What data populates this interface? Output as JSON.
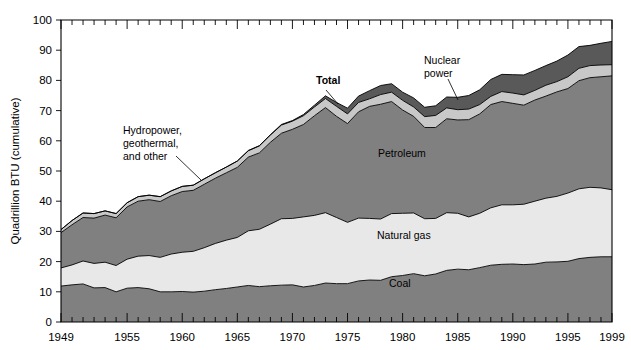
{
  "chart_data": {
    "type": "area",
    "stacked": true,
    "title": "",
    "xlabel": "",
    "ylabel": "Quadrillion BTU (cumulative)",
    "xlim": [
      1949,
      1999
    ],
    "ylim": [
      0,
      100
    ],
    "ytick_values": [
      0,
      10,
      20,
      30,
      40,
      50,
      60,
      70,
      80,
      90,
      100
    ],
    "ytick_labels": [
      "0",
      "10",
      "20",
      "30",
      "40",
      "50",
      "60",
      "70",
      "80",
      "90",
      "100"
    ],
    "xtick_values": [
      1949,
      1955,
      1960,
      1965,
      1970,
      1975,
      1980,
      1985,
      1990,
      1995,
      1999
    ],
    "xtick_labels": [
      "1949",
      "1955",
      "1960",
      "1965",
      "1970",
      "1975",
      "1980",
      "1985",
      "1990",
      "1995",
      "1999"
    ],
    "minor_xtick_interval": 1,
    "grid": false,
    "legend_position": "inline-annotations",
    "x": [
      1949,
      1950,
      1951,
      1952,
      1953,
      1954,
      1955,
      1956,
      1957,
      1958,
      1959,
      1960,
      1961,
      1962,
      1963,
      1964,
      1965,
      1966,
      1967,
      1968,
      1969,
      1970,
      1971,
      1972,
      1973,
      1974,
      1975,
      1976,
      1977,
      1978,
      1979,
      1980,
      1981,
      1982,
      1983,
      1984,
      1985,
      1986,
      1987,
      1988,
      1989,
      1990,
      1991,
      1992,
      1993,
      1994,
      1995,
      1996,
      1997,
      1998,
      1999
    ],
    "series": [
      {
        "name": "Coal",
        "color": "#808080",
        "values": [
          11.9,
          12.3,
          12.6,
          11.3,
          11.4,
          10.0,
          11.2,
          11.4,
          11.0,
          10.0,
          10.0,
          10.1,
          9.9,
          10.2,
          10.7,
          11.1,
          11.6,
          12.1,
          11.7,
          12.0,
          12.2,
          12.3,
          11.6,
          12.1,
          12.9,
          12.7,
          12.7,
          13.6,
          13.9,
          13.8,
          15.0,
          15.4,
          16.0,
          15.3,
          15.9,
          17.1,
          17.5,
          17.3,
          18.0,
          18.8,
          19.1,
          19.2,
          19.0,
          19.2,
          19.8,
          19.9,
          20.1,
          21.0,
          21.4,
          21.6,
          21.6
        ]
      },
      {
        "name": "Natural gas",
        "color": "#e8e8e8",
        "values": [
          6.0,
          6.6,
          7.6,
          8.1,
          8.4,
          8.7,
          9.6,
          10.4,
          11.0,
          11.4,
          12.5,
          13.0,
          13.5,
          14.4,
          15.3,
          16.0,
          16.4,
          18.1,
          19.0,
          20.4,
          22.0,
          22.0,
          23.2,
          23.2,
          23.3,
          21.9,
          20.3,
          20.8,
          20.4,
          20.3,
          20.9,
          20.6,
          20.1,
          18.9,
          18.4,
          19.1,
          18.5,
          17.5,
          18.0,
          19.0,
          19.7,
          19.6,
          20.0,
          20.8,
          21.2,
          21.7,
          22.6,
          23.1,
          23.2,
          22.8,
          22.2
        ]
      },
      {
        "name": "Petroleum",
        "color": "#808080",
        "values": [
          11.7,
          13.3,
          14.4,
          15.0,
          15.6,
          15.8,
          17.3,
          18.2,
          18.5,
          18.5,
          19.3,
          20.1,
          20.2,
          21.0,
          21.6,
          22.3,
          23.2,
          24.4,
          25.3,
          27.1,
          28.3,
          29.5,
          30.6,
          33.0,
          34.8,
          33.5,
          32.7,
          35.2,
          37.1,
          38.0,
          37.1,
          34.2,
          32.0,
          30.2,
          30.1,
          31.1,
          30.9,
          32.2,
          32.9,
          34.2,
          34.2,
          33.6,
          32.8,
          33.5,
          33.8,
          34.6,
          34.6,
          35.8,
          36.3,
          36.8,
          37.7
        ]
      },
      {
        "name": "Hydropower, geothermal, and other",
        "color": "#c8c8c8",
        "values": [
          1.0,
          1.4,
          1.5,
          1.5,
          1.4,
          1.4,
          1.4,
          1.5,
          1.5,
          1.6,
          1.6,
          1.7,
          1.7,
          1.8,
          1.8,
          1.9,
          2.1,
          2.1,
          2.3,
          2.4,
          2.7,
          2.7,
          2.9,
          2.9,
          3.0,
          3.3,
          3.2,
          3.1,
          2.5,
          3.2,
          3.1,
          3.2,
          3.1,
          3.6,
          4.0,
          3.6,
          3.4,
          3.5,
          3.1,
          2.7,
          3.3,
          3.4,
          3.4,
          3.2,
          3.6,
          3.4,
          3.9,
          4.1,
          4.0,
          3.9,
          3.7
        ]
      },
      {
        "name": "Nuclear power",
        "color": "#595959",
        "values": [
          0.0,
          0.0,
          0.0,
          0.0,
          0.0,
          0.0,
          0.0,
          0.0,
          0.0,
          0.0,
          0.0,
          0.0,
          0.0,
          0.0,
          0.0,
          0.0,
          0.0,
          0.1,
          0.1,
          0.1,
          0.2,
          0.2,
          0.4,
          0.6,
          0.9,
          1.3,
          1.9,
          2.1,
          2.7,
          3.0,
          2.8,
          2.7,
          3.0,
          3.1,
          3.2,
          3.6,
          4.1,
          4.5,
          4.9,
          5.6,
          5.7,
          6.1,
          6.6,
          6.6,
          6.5,
          6.8,
          7.2,
          7.2,
          6.7,
          7.2,
          7.7
        ]
      }
    ],
    "annotations": [
      {
        "text_lines": [
          "Hydropower,",
          "geothermal,",
          "and other"
        ],
        "bold": false,
        "text_x": 123,
        "text_y": 134,
        "leader": [
          [
            176,
            156
          ],
          [
            201,
            180
          ]
        ],
        "name": "hydropower-label"
      },
      {
        "text_lines": [
          "Total"
        ],
        "bold": true,
        "text_x": 316,
        "text_y": 84,
        "leader": [
          [
            326,
            90
          ],
          [
            338,
            104
          ]
        ],
        "name": "total-label"
      },
      {
        "text_lines": [
          "Nuclear",
          "power"
        ],
        "bold": false,
        "text_x": 424,
        "text_y": 64,
        "leader": [
          [
            448,
            79
          ],
          [
            458,
            100
          ]
        ],
        "name": "nuclear-power-label"
      },
      {
        "text_lines": [
          "Petroleum"
        ],
        "bold": false,
        "text_x": 378,
        "text_y": 157,
        "leader": null,
        "name": "petroleum-label"
      },
      {
        "text_lines": [
          "Natural gas"
        ],
        "bold": false,
        "text_x": 377,
        "text_y": 239,
        "leader": null,
        "name": "natural-gas-label"
      },
      {
        "text_lines": [
          "Coal"
        ],
        "bold": false,
        "text_x": 389,
        "text_y": 287,
        "leader": null,
        "name": "coal-label"
      }
    ]
  },
  "colors": {
    "coal": "#808080",
    "natural_gas": "#e8e8e8",
    "petroleum": "#808080",
    "hydro": "#c8c8c8",
    "nuclear": "#595959",
    "axis": "#000000",
    "background": "#ffffff"
  }
}
